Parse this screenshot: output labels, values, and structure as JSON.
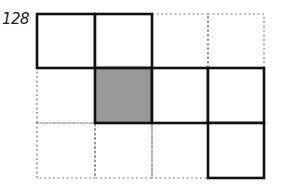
{
  "figure": {
    "label": "128",
    "grid": {
      "rows": 3,
      "cols": 4,
      "origin": [
        37,
        14
      ],
      "col_x": [
        37,
        95,
        152,
        208,
        264
      ],
      "row_y": [
        14,
        68,
        123,
        178
      ]
    },
    "solid_cells": [
      [
        0,
        0
      ],
      [
        0,
        1
      ],
      [
        1,
        1
      ],
      [
        1,
        2
      ],
      [
        1,
        3
      ],
      [
        2,
        3
      ]
    ],
    "shaded_cells": [
      [
        1,
        1
      ]
    ],
    "dotted_cells": [
      [
        0,
        2
      ],
      [
        0,
        3
      ],
      [
        1,
        0
      ],
      [
        2,
        0
      ],
      [
        2,
        1
      ],
      [
        2,
        2
      ]
    ],
    "colors": {
      "solid_stroke": "#111111",
      "dotted_stroke": "#777777",
      "shade_fill": "#999999"
    }
  }
}
